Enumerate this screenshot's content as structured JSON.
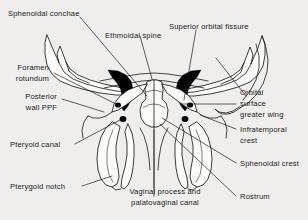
{
  "figure": {
    "background_color": "#efeeec",
    "line_color": "#1b1b1b",
    "fill_color": "#fbfbfa",
    "accent_fill_color": "#000000"
  },
  "labels": {
    "sphenoidal_conchae": "Sphenoidal conchae",
    "ethmoidal_spine": "Ethmoidal spine",
    "superior_orbital_fissure": "Superior orbital fissure",
    "foramen_rotundum_line1": "Foramen",
    "foramen_rotundum_line2": "rotundum",
    "posterior_wall_ppf_line1": "Posterior",
    "posterior_wall_ppf_line2": "wall PPF",
    "pteryoid_canal": "Pteryoid canal",
    "pterygoid_notch": "Pterygoid notch",
    "vaginal_process_line1": "Vaginal process and",
    "vaginal_process_line2": "palatovaginal canal",
    "rostrum": "Rostrum",
    "sphenoidal_crest": "Sphenoidal crest",
    "infratemporal_crest_line1": "Infratemporal",
    "infratemporal_crest_line2": "crest",
    "orbital_surface_line1": "Orbital",
    "orbital_surface_line2": "surface",
    "orbital_surface_line3": "greater wing"
  }
}
